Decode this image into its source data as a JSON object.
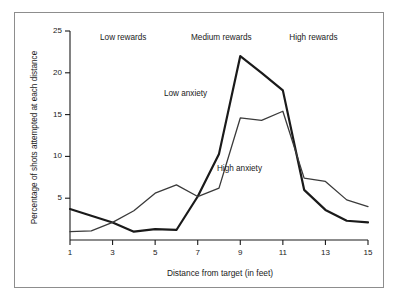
{
  "chart_data": {
    "type": "line",
    "title": "",
    "xlabel": "Distance from target (in feet)",
    "ylabel": "Percentage of shots attempted at each distance",
    "x": [
      1,
      2,
      3,
      4,
      5,
      6,
      7,
      8,
      9,
      10,
      11,
      12,
      13,
      14,
      15
    ],
    "xlim": [
      1,
      15
    ],
    "ylim": [
      0,
      25
    ],
    "xticks": [
      1,
      3,
      5,
      7,
      9,
      11,
      13,
      15
    ],
    "yticks": [
      5,
      10,
      15,
      20,
      25
    ],
    "xtick_labels": [
      "1",
      "3",
      "5",
      "7",
      "9",
      "11",
      "13",
      "15"
    ],
    "ytick_labels": [
      "5",
      "10",
      "15",
      "20",
      "25"
    ],
    "grid": false,
    "legend": "inline-annotations",
    "series": [
      {
        "name": "Low anxiety",
        "style": "thick",
        "color": "#1a1a1a",
        "values": [
          3.7,
          2.9,
          2.1,
          1.0,
          1.3,
          1.2,
          5.2,
          10.3,
          22.0,
          20.0,
          17.9,
          6.0,
          3.6,
          2.3,
          2.1
        ]
      },
      {
        "name": "High anxiety",
        "style": "thin",
        "color": "#3a3a3a",
        "values": [
          1.0,
          1.1,
          2.1,
          3.5,
          5.6,
          6.6,
          5.2,
          6.2,
          14.6,
          14.3,
          15.4,
          7.4,
          7.0,
          4.8,
          4.0
        ]
      }
    ],
    "annotations": [
      {
        "text": "Low rewards",
        "x": 3.6,
        "y": 24.0
      },
      {
        "text": "Medium rewards",
        "x": 8.2,
        "y": 24.0
      },
      {
        "text": "High rewards",
        "x": 12.6,
        "y": 24.0
      },
      {
        "text": "Low anxiety",
        "x": 6.6,
        "y": 17.4
      },
      {
        "text": "High anxiety",
        "x": 9.2,
        "y": 8.4
      }
    ]
  },
  "axes": {
    "y_title": "Percentage of shots attempted at each distance",
    "x_title": "Distance from target (in feet)",
    "y_ticks": [
      "25",
      "20",
      "15",
      "10",
      "5"
    ],
    "x_ticks": [
      "1",
      "3",
      "5",
      "7",
      "9",
      "11",
      "13",
      "15"
    ]
  },
  "regions": {
    "low": "Low rewards",
    "medium": "Medium rewards",
    "high": "High rewards"
  },
  "series_labels": {
    "low_anxiety": "Low anxiety",
    "high_anxiety": "High anxiety"
  },
  "colors": {
    "line": "#1a1a1a",
    "thin_line": "#3a3a3a",
    "frame": "#8d8d8d",
    "axis": "#1a1a1a",
    "background": "#ffffff"
  }
}
